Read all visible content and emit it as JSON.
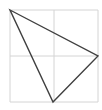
{
  "diagram": {
    "type": "triangle-in-grid",
    "grid": {
      "x": 10,
      "y": 10,
      "width": 88,
      "height": 92,
      "divisions": 2,
      "color": "#d4d4d4"
    },
    "triangle": {
      "points": [
        [
          10,
          10
        ],
        [
          98,
          56
        ],
        [
          53,
          102
        ]
      ],
      "stroke": "#404040",
      "stroke_width": 1.4
    }
  }
}
